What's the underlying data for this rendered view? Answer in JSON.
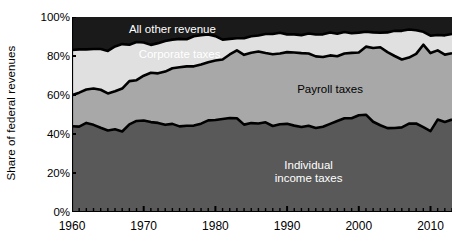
{
  "chart_data": {
    "type": "area",
    "stacked": true,
    "normalized_percent": true,
    "title": "",
    "subtitle": "",
    "xlabel": "",
    "ylabel": "Share of federal revenues",
    "xlim": [
      1960,
      2013
    ],
    "ylim": [
      0,
      100
    ],
    "grid": false,
    "legend_position": "inline-annotations",
    "y_tick_labels": [
      "0%",
      "20%",
      "40%",
      "60%",
      "80%",
      "100%"
    ],
    "y_tick_values": [
      0,
      20,
      40,
      60,
      80,
      100
    ],
    "x_tick_labels": [
      "1960",
      "1970",
      "1980",
      "1990",
      "2000",
      "2010"
    ],
    "x_tick_values": [
      1960,
      1970,
      1980,
      1990,
      2000,
      2010
    ],
    "x_minor_tick_interval": 1,
    "x": [
      1960,
      1961,
      1962,
      1963,
      1964,
      1965,
      1966,
      1967,
      1968,
      1969,
      1970,
      1971,
      1972,
      1973,
      1974,
      1975,
      1976,
      1977,
      1978,
      1979,
      1980,
      1981,
      1982,
      1983,
      1984,
      1985,
      1986,
      1987,
      1988,
      1989,
      1990,
      1991,
      1992,
      1993,
      1994,
      1995,
      1996,
      1997,
      1998,
      1999,
      2000,
      2001,
      2002,
      2003,
      2004,
      2005,
      2006,
      2007,
      2008,
      2009,
      2010,
      2011,
      2012,
      2013
    ],
    "series": [
      {
        "name": "Individual income taxes",
        "color": "#595959",
        "order": 1,
        "values": [
          44.0,
          43.8,
          45.7,
          44.7,
          43.2,
          41.8,
          42.4,
          41.3,
          44.9,
          46.7,
          46.9,
          46.1,
          45.7,
          44.7,
          45.2,
          43.9,
          44.2,
          44.3,
          45.3,
          47.0,
          47.2,
          47.7,
          48.2,
          48.1,
          44.8,
          45.6,
          45.4,
          46.0,
          44.1,
          45.0,
          45.2,
          44.3,
          43.6,
          44.2,
          43.1,
          43.7,
          45.2,
          46.7,
          48.1,
          48.1,
          49.6,
          49.9,
          46.3,
          44.5,
          43.0,
          43.1,
          43.4,
          45.3,
          45.4,
          43.5,
          41.5,
          47.4,
          46.2,
          47.4
        ]
      },
      {
        "name": "Payroll taxes",
        "color": "#a8a8a8",
        "order": 2,
        "values": [
          15.9,
          17.4,
          17.1,
          18.6,
          19.5,
          19.0,
          19.5,
          22.0,
          22.2,
          20.9,
          23.0,
          25.3,
          25.4,
          27.3,
          28.5,
          30.3,
          30.5,
          30.4,
          30.3,
          29.8,
          30.5,
          30.5,
          32.6,
          34.8,
          35.8,
          36.1,
          36.9,
          35.5,
          36.8,
          36.3,
          36.8,
          37.5,
          37.9,
          37.1,
          36.7,
          35.8,
          35.1,
          33.2,
          33.2,
          33.5,
          32.2,
          34.9,
          37.8,
          40.0,
          39.0,
          36.9,
          34.8,
          33.9,
          35.7,
          42.3,
          40.0,
          35.5,
          34.5,
          34.0
        ]
      },
      {
        "name": "Corporate taxes",
        "color": "#e0e0e0",
        "order": 3,
        "values": [
          23.2,
          22.2,
          20.6,
          20.3,
          20.9,
          21.8,
          23.0,
          22.8,
          18.7,
          19.6,
          17.0,
          14.3,
          15.5,
          15.7,
          14.7,
          14.6,
          13.9,
          15.4,
          15.0,
          14.2,
          12.5,
          10.2,
          8.0,
          6.2,
          8.5,
          8.4,
          8.2,
          9.8,
          10.4,
          10.6,
          9.1,
          9.3,
          9.2,
          10.2,
          11.2,
          11.6,
          11.8,
          11.5,
          11.0,
          10.1,
          10.2,
          7.6,
          8.0,
          7.4,
          10.1,
          12.9,
          14.7,
          14.4,
          12.1,
          6.6,
          8.9,
          7.9,
          9.9,
          9.9
        ]
      },
      {
        "name": "All other revenue",
        "color": "#1a1a1a",
        "order": 4,
        "values": [
          16.9,
          16.6,
          16.6,
          16.4,
          16.4,
          17.4,
          15.1,
          13.9,
          14.2,
          12.8,
          13.1,
          14.3,
          13.4,
          12.3,
          11.6,
          11.2,
          11.4,
          9.9,
          9.4,
          9.0,
          9.8,
          11.6,
          11.2,
          10.9,
          10.9,
          9.9,
          9.5,
          8.7,
          8.7,
          8.1,
          8.9,
          8.9,
          9.3,
          8.5,
          9.0,
          8.9,
          7.9,
          8.6,
          7.7,
          8.3,
          8.0,
          7.6,
          7.9,
          8.1,
          7.9,
          7.1,
          7.1,
          6.4,
          6.8,
          7.6,
          9.6,
          9.2,
          9.4,
          8.7
        ]
      }
    ],
    "annotations": [
      {
        "name": "all-other-revenue-label",
        "text": "All other revenue",
        "x": 1974,
        "y": 93,
        "color": "#ffffff"
      },
      {
        "name": "corporate-taxes-label",
        "text": "Corporate taxes",
        "x": 1975,
        "y": 80,
        "color": "#ffffff"
      },
      {
        "name": "payroll-taxes-label",
        "text": "Payroll taxes",
        "x": 1996,
        "y": 62,
        "color": "#000000"
      },
      {
        "name": "individual-income-taxes-label",
        "text": "Individual\nincome taxes",
        "x": 1993,
        "y": 23,
        "color": "#ffffff"
      }
    ]
  },
  "axis": {
    "y_label": "Share of federal revenues",
    "y_ticks": [
      {
        "label": "100%",
        "value": 100
      },
      {
        "label": "80%",
        "value": 80
      },
      {
        "label": "60%",
        "value": 60
      },
      {
        "label": "40%",
        "value": 40
      },
      {
        "label": "20%",
        "value": 20
      },
      {
        "label": "0%",
        "value": 0
      }
    ],
    "x_ticks": [
      {
        "label": "1960",
        "value": 1960
      },
      {
        "label": "1970",
        "value": 1970
      },
      {
        "label": "1980",
        "value": 1980
      },
      {
        "label": "1990",
        "value": 1990
      },
      {
        "label": "2000",
        "value": 2000
      },
      {
        "label": "2010",
        "value": 2010
      }
    ]
  },
  "labels": {
    "all_other_revenue": "All other revenue",
    "corporate_taxes": "Corporate taxes",
    "payroll_taxes": "Payroll taxes",
    "individual_income_taxes_line1": "Individual",
    "individual_income_taxes_line2": "income taxes"
  },
  "colors": {
    "all_other_revenue": "#1a1a1a",
    "corporate_taxes": "#e0e0e0",
    "payroll_taxes": "#a8a8a8",
    "individual_income_taxes": "#595959",
    "axis": "#000000",
    "background": "#ffffff",
    "band_outline": "#000000"
  }
}
